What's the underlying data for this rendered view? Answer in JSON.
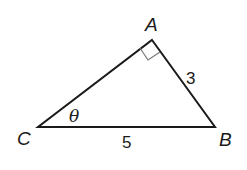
{
  "diagram": {
    "type": "right-triangle",
    "vertices": {
      "A": {
        "label": "A",
        "x": 152,
        "y": 40
      },
      "B": {
        "label": "B",
        "x": 215,
        "y": 127
      },
      "C": {
        "label": "C",
        "x": 38,
        "y": 127
      }
    },
    "sides": {
      "AB": {
        "label": "3"
      },
      "CB": {
        "label": "5"
      }
    },
    "angle": {
      "label": "θ",
      "at": "C"
    },
    "right_angle_at": "A",
    "colors": {
      "stroke": "#1a1a1a",
      "right_angle_mark": "#777777",
      "background": "#ffffff"
    }
  }
}
